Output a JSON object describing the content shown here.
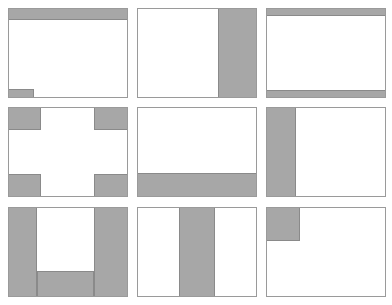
{
  "diagram": {
    "colors": {
      "frame_border": "#9a9a9a",
      "region_fill": "#a7a7a7",
      "region_border": "#8a8a8a",
      "background": "#ffffff"
    },
    "panel_size": {
      "w": 120,
      "h": 90
    },
    "panels": [
      {
        "name": "header-with-bottom-left-tab",
        "x": 8,
        "y": 8,
        "regions": [
          {
            "x": 0,
            "y": 0,
            "w": 120,
            "h": 12
          },
          {
            "x": 0,
            "y": 81,
            "w": 26,
            "h": 9
          }
        ]
      },
      {
        "name": "right-sidebar",
        "x": 137,
        "y": 8,
        "regions": [
          {
            "x": 81,
            "y": 0,
            "w": 39,
            "h": 90
          }
        ]
      },
      {
        "name": "header-and-footer",
        "x": 266,
        "y": 8,
        "regions": [
          {
            "x": 0,
            "y": 0,
            "w": 120,
            "h": 8
          },
          {
            "x": 0,
            "y": 82,
            "w": 120,
            "h": 8
          }
        ]
      },
      {
        "name": "four-corners",
        "x": 8,
        "y": 107,
        "regions": [
          {
            "x": 0,
            "y": 0,
            "w": 33,
            "h": 23
          },
          {
            "x": 86,
            "y": 0,
            "w": 34,
            "h": 23
          },
          {
            "x": 0,
            "y": 67,
            "w": 33,
            "h": 23
          },
          {
            "x": 86,
            "y": 67,
            "w": 34,
            "h": 23
          }
        ]
      },
      {
        "name": "footer-band",
        "x": 137,
        "y": 107,
        "regions": [
          {
            "x": 0,
            "y": 66,
            "w": 120,
            "h": 24
          }
        ]
      },
      {
        "name": "left-sidebar",
        "x": 266,
        "y": 107,
        "regions": [
          {
            "x": 0,
            "y": 0,
            "w": 30,
            "h": 90
          }
        ]
      },
      {
        "name": "u-shape",
        "x": 8,
        "y": 207,
        "regions": [
          {
            "x": 0,
            "y": 0,
            "w": 29,
            "h": 90
          },
          {
            "x": 86,
            "y": 0,
            "w": 34,
            "h": 90
          },
          {
            "x": 29,
            "y": 64,
            "w": 57,
            "h": 26
          }
        ]
      },
      {
        "name": "center-column",
        "x": 137,
        "y": 207,
        "regions": [
          {
            "x": 42,
            "y": 0,
            "w": 36,
            "h": 90
          }
        ]
      },
      {
        "name": "top-left-block",
        "x": 266,
        "y": 207,
        "regions": [
          {
            "x": 0,
            "y": 0,
            "w": 34,
            "h": 34
          }
        ]
      }
    ]
  }
}
